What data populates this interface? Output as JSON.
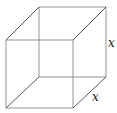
{
  "figure": {
    "type": "wireframe-cube",
    "labels": {
      "right_edge": "x",
      "depth_edge": "x"
    },
    "colors": {
      "background": "#ffffff",
      "edge": "#7a7a7a",
      "diagonal_edge": "#444444",
      "label": "#222222"
    }
  }
}
